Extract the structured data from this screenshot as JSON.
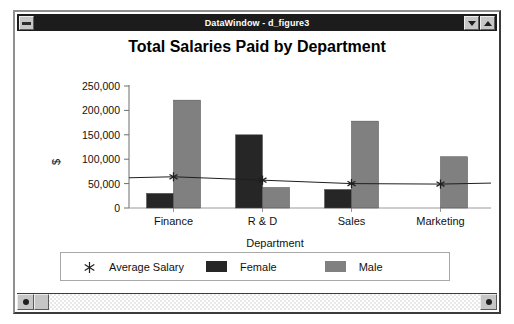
{
  "window": {
    "title": "DataWindow - d_figure3",
    "sysmenu_icon": "window-menu-icon",
    "minimize_icon": "minimize-triangle-down-icon",
    "maximize_icon": "maximize-triangle-up-icon"
  },
  "scrollbar": {
    "left_arrow_icon": "scroll-left-icon",
    "right_arrow_icon": "scroll-right-icon"
  },
  "legend": {
    "avg_marker_icon": "asterisk-marker-icon",
    "entries": [
      {
        "label": "Average Salary",
        "marker": "asterisk",
        "color": "#1f1f1f"
      },
      {
        "label": "Female",
        "marker": "swatch",
        "color": "#262626"
      },
      {
        "label": "Male",
        "marker": "swatch",
        "color": "#808080"
      }
    ]
  },
  "chart_data": {
    "type": "bar",
    "title": "Total Salaries Paid by Department",
    "xlabel": "Department",
    "ylabel": "$",
    "categories": [
      "Finance",
      "R & D",
      "Sales",
      "Marketing"
    ],
    "ylim": [
      0,
      250000
    ],
    "yticks": [
      0,
      50000,
      100000,
      150000,
      200000,
      250000
    ],
    "ytick_labels": [
      "0",
      "50,000",
      "100,000",
      "150,000",
      "200,000",
      "250,000"
    ],
    "grid": false,
    "legend_position": "bottom",
    "series": [
      {
        "name": "Female",
        "type": "bar",
        "color": "#262626",
        "values": [
          30000,
          150000,
          38000,
          0
        ]
      },
      {
        "name": "Male",
        "type": "bar",
        "color": "#808080",
        "values": [
          221000,
          42000,
          178000,
          105000
        ]
      },
      {
        "name": "Average Salary",
        "type": "line",
        "color": "#1f1f1f",
        "marker": "asterisk",
        "values": [
          64000,
          57000,
          50000,
          49000
        ]
      }
    ]
  }
}
